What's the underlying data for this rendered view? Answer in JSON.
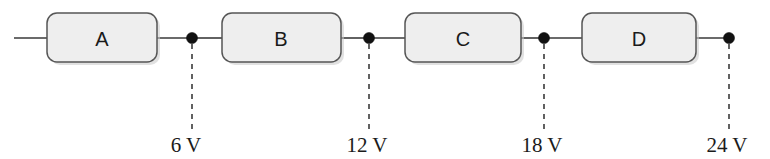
{
  "figure": {
    "background_color": "#ffffff",
    "width": 770,
    "height": 159
  },
  "style": {
    "box_fill": "#eeeeee",
    "box_stroke": "#565656",
    "wire_color": "#3a3a3a",
    "dot_color": "#111111",
    "dash_color": "#2e2e2e",
    "text_color": "#1b1b1b"
  },
  "circuit": {
    "wire": {
      "y": 38,
      "x_start": 14,
      "x_end": 729
    },
    "components": [
      {
        "label": "A",
        "x": 47,
        "y": 13,
        "width": 110,
        "height": 49,
        "center_x": 102
      },
      {
        "label": "B",
        "x": 222,
        "y": 13,
        "width": 119,
        "height": 49,
        "center_x": 281
      },
      {
        "label": "C",
        "x": 405,
        "y": 13,
        "width": 116,
        "height": 49,
        "center_x": 463
      },
      {
        "label": "D",
        "x": 582,
        "y": 13,
        "width": 114,
        "height": 49,
        "center_x": 639
      }
    ],
    "nodes": [
      {
        "x": 192,
        "y": 38,
        "radius": 5.5,
        "voltage": "6 V",
        "value": 6,
        "unit": "V",
        "dash_y_start": 44,
        "dash_y_end": 130,
        "label_y": 152
      },
      {
        "x": 369,
        "y": 38,
        "radius": 5.5,
        "voltage": "12 V",
        "value": 12,
        "unit": "V",
        "dash_y_start": 44,
        "dash_y_end": 130,
        "label_y": 152
      },
      {
        "x": 544,
        "y": 38,
        "radius": 5.5,
        "voltage": "18 V",
        "value": 18,
        "unit": "V",
        "dash_y_start": 44,
        "dash_y_end": 130,
        "label_y": 152
      },
      {
        "x": 729,
        "y": 38,
        "radius": 5.5,
        "voltage": "24 V",
        "value": 24,
        "unit": "V",
        "dash_y_start": 44,
        "dash_y_end": 130,
        "label_y": 152
      }
    ]
  }
}
